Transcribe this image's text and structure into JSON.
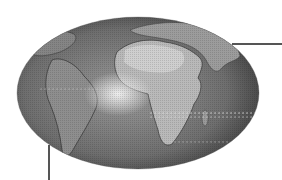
{
  "figure": {
    "colors": {
      "background": "#ffffff",
      "ocean_dark": "#4a4a4a",
      "ocean_mid": "#7a7a7a",
      "land_light": "#bdbdbd",
      "sun_glint": "#e6e6e6",
      "leader_line": "#555555"
    },
    "globe": {
      "cx": 138,
      "cy": 93,
      "rx": 121,
      "ry": 76
    },
    "leaders": [
      {
        "name": "leader-line-right",
        "x1": 232,
        "y1": 44,
        "x2": 282,
        "y2": 44
      },
      {
        "name": "leader-line-bottom",
        "x1": 49,
        "y1": 145,
        "x2": 49,
        "y2": 180
      }
    ],
    "labels": []
  }
}
